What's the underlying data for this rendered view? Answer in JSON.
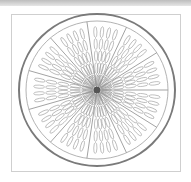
{
  "image": {
    "subject": "citrus slice line drawing",
    "colors": {
      "line": "#7a7a7a",
      "frame": "#cfcfcf",
      "background": "#ffffff"
    }
  }
}
